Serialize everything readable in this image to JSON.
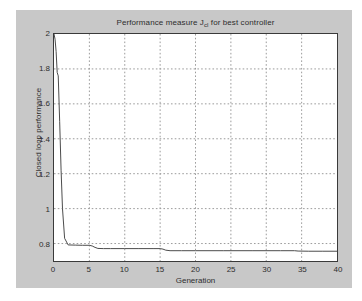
{
  "figure": {
    "background_color": "#c8c8c8",
    "axes_background_color": "#ffffff",
    "axes_border_color": "#3a3a3a",
    "grid_color": "#9a9a9a",
    "line_color": "#4a4a4a"
  },
  "chart_data": {
    "type": "line",
    "title": "Performance measure J",
    "title_subscript": "cl",
    "title_suffix": " for best controller",
    "title_full": "Performance measure J_cl for best controller",
    "xlabel": "Generation",
    "ylabel": "Closed loop performance",
    "xlim": [
      0,
      40
    ],
    "ylim": [
      0.7,
      2
    ],
    "xticks": [
      0,
      5,
      10,
      15,
      20,
      25,
      30,
      35,
      40
    ],
    "xticklabels": [
      "0",
      "5",
      "10",
      "15",
      "20",
      "25",
      "30",
      "35",
      "40"
    ],
    "yticks": [
      0.8,
      1,
      1.2,
      1.4,
      1.6,
      1.8,
      2
    ],
    "yticklabels": [
      "0.8",
      "1",
      "1.2",
      "1.4",
      "1.6",
      "1.8",
      "2"
    ],
    "grid": true,
    "grid_style": "dotted",
    "legend": null,
    "series": [
      {
        "name": "Best controller performance",
        "x": [
          0,
          0.15,
          0.3,
          0.45,
          0.6,
          0.8,
          1.0,
          1.2,
          1.5,
          2,
          3,
          4,
          5,
          5.4,
          5.8,
          6.2,
          7,
          8,
          10,
          12,
          14,
          15,
          15.4,
          15.8,
          16.4,
          18,
          20,
          24,
          28,
          32,
          34,
          34.5,
          36,
          38,
          40
        ],
        "y": [
          2.0,
          1.97,
          1.9,
          1.78,
          1.76,
          1.5,
          1.22,
          1.0,
          0.83,
          0.792,
          0.791,
          0.79,
          0.79,
          0.786,
          0.778,
          0.772,
          0.771,
          0.771,
          0.771,
          0.771,
          0.771,
          0.771,
          0.768,
          0.762,
          0.759,
          0.759,
          0.759,
          0.759,
          0.759,
          0.759,
          0.759,
          0.757,
          0.756,
          0.756,
          0.756
        ]
      }
    ]
  }
}
